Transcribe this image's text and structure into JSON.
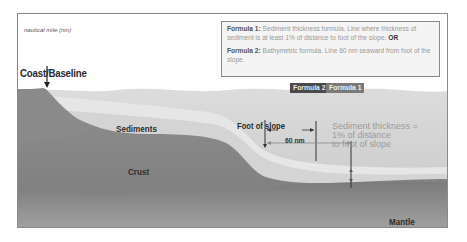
{
  "diagram": {
    "unit_label": "nautical mile (nm)",
    "formula_box": {
      "formula1_title": "Formula 1:",
      "formula1_text": "Sediment thickness formula. Line where thickness of sediment is at least 1% of distance to foot of the slope.",
      "formula1_or": "OR",
      "formula2_title": "Formula 2:",
      "formula2_text": "Bathymetric formula. Line 60 nm seaward from foot of the slope."
    },
    "tags": {
      "formula2": "Formula 2",
      "formula1": "Formula 1"
    },
    "labels": {
      "coast": "Coast/Baseline",
      "sediments": "Sediments",
      "crust": "Crust",
      "mantle": "Mantle",
      "foot_of_slope": "Foot of slope",
      "distance": "60 nm",
      "sediment_thickness_line1": "Sediment thickness =",
      "sediment_thickness_line2": "1% of distance",
      "sediment_thickness_line3": "to foot of slope"
    },
    "colors": {
      "water_top": "#e2e2e2",
      "water": "#cfcfcf",
      "sediment_light": "#e9e9e9",
      "sediment": "#d8d8d8",
      "crust": "#8c8c8c",
      "crust_dark": "#7a7a7a",
      "mantle": "#6e6e6e",
      "land": "#8a8a8a",
      "tag_formula2": "#4a4a4a",
      "tag_formula1": "#7a7a7a"
    }
  }
}
